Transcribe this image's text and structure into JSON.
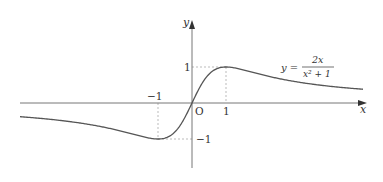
{
  "figure": {
    "equation_lhs": "y =",
    "equation_numerator": "2x",
    "equation_denominator": "x² + 1",
    "x_axis_label": "x",
    "y_axis_label": "y",
    "origin_label": "O",
    "x_ticks": [
      {
        "value": -1,
        "label": "−1"
      },
      {
        "value": 1,
        "label": "1"
      }
    ],
    "y_ticks": [
      {
        "value": 1,
        "label": "1"
      },
      {
        "value": -1,
        "label": "−1"
      }
    ],
    "colors": {
      "curve": "#555555",
      "axis": "#777777",
      "guide": "#aaaaaa",
      "text": "#333333"
    }
  },
  "chart_data": {
    "type": "line",
    "title": "",
    "function": "y = 2x/(x^2+1)",
    "xlabel": "x",
    "ylabel": "y",
    "xlim": [
      -5.1,
      5.1
    ],
    "ylim": [
      -2.0,
      2.3
    ],
    "grid": false,
    "annotations": [
      "O",
      "max (1, 1)",
      "min (-1, -1)"
    ],
    "key_points": [
      {
        "x": -1,
        "y": -1,
        "type": "minimum"
      },
      {
        "x": 0,
        "y": 0,
        "type": "origin"
      },
      {
        "x": 1,
        "y": 1,
        "type": "maximum"
      }
    ],
    "series": [
      {
        "name": "y = 2x/(x²+1)",
        "x": [
          -5,
          -4,
          -3,
          -2,
          -1,
          -0.5,
          0,
          0.5,
          1,
          2,
          3,
          4,
          5
        ],
        "values": [
          -0.385,
          -0.471,
          -0.6,
          -0.8,
          -1,
          -0.8,
          0,
          0.8,
          1,
          0.8,
          0.6,
          0.471,
          0.385
        ]
      }
    ]
  }
}
